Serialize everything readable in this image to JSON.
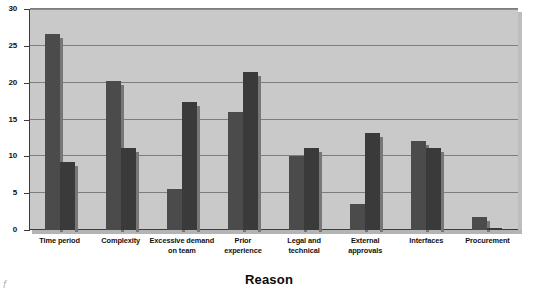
{
  "chart_data": {
    "type": "bar",
    "title": "",
    "xlabel": "Reason",
    "ylabel": "",
    "ylim": [
      0,
      30
    ],
    "yticks": [
      0,
      5,
      10,
      15,
      20,
      25,
      30
    ],
    "ytick_labels": [
      "0",
      "5",
      "10",
      "15",
      "20",
      "25",
      "30"
    ],
    "grid": true,
    "grid_axis": "y",
    "legend": "none",
    "categories": [
      "Time period",
      "Complexity",
      "Excessive demand\non team",
      "Prior\nexperience",
      "Legal and\ntechnical",
      "External\napprovals",
      "Interfaces",
      "Procurement"
    ],
    "series": [
      {
        "name": "Series 1",
        "color": "#4b4b4b",
        "values": [
          26.6,
          20.2,
          5.6,
          16.0,
          10.0,
          3.5,
          12.1,
          1.8
        ]
      },
      {
        "name": "Series 2",
        "color": "#3a3a3a",
        "values": [
          9.2,
          11.2,
          17.4,
          21.5,
          11.2,
          13.2,
          11.2,
          0.3
        ]
      }
    ],
    "plot_background": "#c9c9c9",
    "page_background": "#ffffff",
    "gridline_color": "#7d7d7d",
    "axis_color": "#3c3c3c"
  },
  "axis_title_text": "Reason",
  "corner_mark": "f"
}
